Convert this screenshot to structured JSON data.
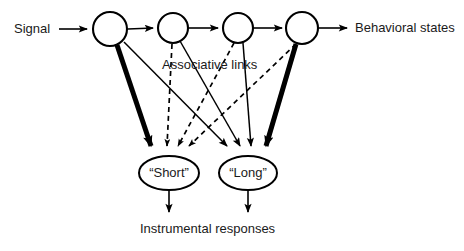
{
  "figure": {
    "type": "diagram",
    "subtype": "node-link associative network",
    "background": "#ffffff",
    "line_color": "#000000",
    "text_color": "#1a1a1a",
    "width": 464,
    "height": 251
  },
  "labels": {
    "input": "Signal",
    "output": "Behavioral states",
    "associative": "Associative links",
    "responses": "Instrumental responses"
  },
  "chain_nodes": [
    {
      "id": "n1",
      "label": "",
      "cx": 110,
      "cy": 29,
      "r": 17
    },
    {
      "id": "n2",
      "label": "",
      "cx": 173,
      "cy": 28,
      "r": 15
    },
    {
      "id": "n3",
      "label": "",
      "cx": 238,
      "cy": 28,
      "r": 15
    },
    {
      "id": "n4",
      "label": "",
      "cx": 302,
      "cy": 28,
      "r": 16
    }
  ],
  "response_nodes": [
    {
      "id": "short",
      "label": "“Short”",
      "cx": 169,
      "cy": 173,
      "rx": 30,
      "ry": 17
    },
    {
      "id": "long",
      "label": "“Long”",
      "cx": 248,
      "cy": 173,
      "rx": 29,
      "ry": 17
    }
  ],
  "edges": [
    {
      "from": "signal",
      "to": "n1",
      "style": "solid",
      "weight": "thin"
    },
    {
      "from": "n1",
      "to": "n2",
      "style": "solid",
      "weight": "thin"
    },
    {
      "from": "n2",
      "to": "n3",
      "style": "solid",
      "weight": "thin"
    },
    {
      "from": "n3",
      "to": "n4",
      "style": "solid",
      "weight": "thin"
    },
    {
      "from": "n4",
      "to": "behavioral-states",
      "style": "solid",
      "weight": "thin"
    },
    {
      "from": "n1",
      "to": "short",
      "style": "solid",
      "weight": "thick"
    },
    {
      "from": "n1",
      "to": "long",
      "style": "solid",
      "weight": "thin"
    },
    {
      "from": "n2",
      "to": "short",
      "style": "dashed",
      "weight": "thin"
    },
    {
      "from": "n2",
      "to": "long",
      "style": "solid",
      "weight": "thin"
    },
    {
      "from": "n3",
      "to": "short",
      "style": "dashed",
      "weight": "thin"
    },
    {
      "from": "n3",
      "to": "long",
      "style": "solid",
      "weight": "thin"
    },
    {
      "from": "n4",
      "to": "short",
      "style": "dashed",
      "weight": "thin"
    },
    {
      "from": "n4",
      "to": "long",
      "style": "solid",
      "weight": "thick"
    },
    {
      "from": "short",
      "to": "instrumental-responses",
      "style": "solid",
      "weight": "thin"
    },
    {
      "from": "long",
      "to": "instrumental-responses",
      "style": "solid",
      "weight": "thin"
    }
  ]
}
